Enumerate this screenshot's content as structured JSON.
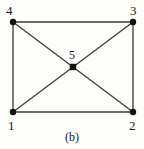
{
  "figure": {
    "caption": "(b)",
    "type": "graph-diagram",
    "background_color": "#fdfdfa",
    "edge_color": "#3a3a3a",
    "node_color": "#111111"
  },
  "chart_data": {
    "type": "diagram",
    "title": "",
    "caption": "(b)",
    "nodes": [
      {
        "id": "1",
        "label": "1",
        "x": 13,
        "y": 112,
        "label_position": "below-left"
      },
      {
        "id": "2",
        "label": "2",
        "x": 133,
        "y": 112,
        "label_position": "below-right"
      },
      {
        "id": "3",
        "label": "3",
        "x": 133,
        "y": 22,
        "label_position": "above-right"
      },
      {
        "id": "4",
        "label": "4",
        "x": 13,
        "y": 22,
        "label_position": "above-left"
      },
      {
        "id": "5",
        "label": "5",
        "x": 73,
        "y": 67,
        "label_position": "above"
      }
    ],
    "edges": [
      {
        "from": "4",
        "to": "3"
      },
      {
        "from": "3",
        "to": "2"
      },
      {
        "from": "2",
        "to": "1"
      },
      {
        "from": "1",
        "to": "4"
      },
      {
        "from": "4",
        "to": "5"
      },
      {
        "from": "5",
        "to": "3"
      },
      {
        "from": "1",
        "to": "5"
      },
      {
        "from": "5",
        "to": "2"
      }
    ],
    "node_radius": 3,
    "edge_width": 1.3,
    "xlabel": "",
    "ylabel": "",
    "grid": false,
    "legend": null
  },
  "labels": {
    "n1": "1",
    "n2": "2",
    "n3": "3",
    "n4": "4",
    "n5": "5"
  }
}
